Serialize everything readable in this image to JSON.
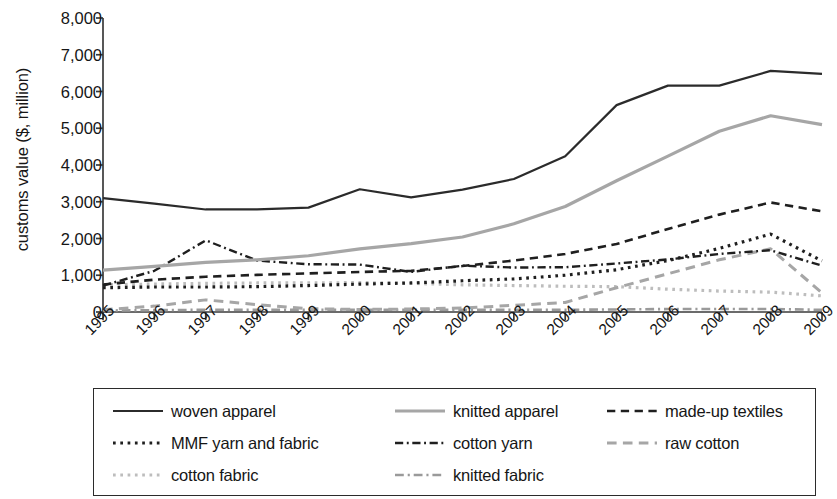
{
  "chart_data": {
    "type": "line",
    "title": "",
    "xlabel": "",
    "ylabel": "customs value ($, million)",
    "grid": false,
    "legend_position": "bottom",
    "x": [
      "1995",
      "1996",
      "1997",
      "1998",
      "1999",
      "2000",
      "2001",
      "2002",
      "2003",
      "2004",
      "2005",
      "2006",
      "2007",
      "2008",
      "2009"
    ],
    "xlim": [
      "1995",
      "2009"
    ],
    "ylim": [
      0,
      8000
    ],
    "yticks": [
      0,
      1000,
      2000,
      3000,
      4000,
      5000,
      6000,
      7000,
      8000
    ],
    "ytick_labels": [
      "0",
      "1,000",
      "2,000",
      "3,000",
      "4,000",
      "5,000",
      "6,000",
      "7,000",
      "8,000"
    ],
    "series": [
      {
        "name": "woven apparel",
        "style": "solid",
        "color": "#2b2b2b",
        "width": 2.2,
        "values": [
          3100,
          2950,
          2790,
          2790,
          2840,
          3340,
          3120,
          3330,
          3620,
          4240,
          5630,
          6160,
          6160,
          6560,
          6480
        ]
      },
      {
        "name": "knitted apparel",
        "style": "solid",
        "color": "#a6a6a6",
        "width": 3.2,
        "values": [
          1140,
          1240,
          1350,
          1420,
          1530,
          1720,
          1860,
          2040,
          2400,
          2870,
          3570,
          4240,
          4920,
          5340,
          5100
        ]
      },
      {
        "name": "made-up textiles",
        "style": "dashed",
        "color": "#1f1f1f",
        "width": 2.6,
        "values": [
          750,
          880,
          960,
          1010,
          1050,
          1090,
          1120,
          1250,
          1400,
          1580,
          1850,
          2260,
          2650,
          2980,
          2740
        ]
      },
      {
        "name": "MMF yarn and fabric",
        "style": "dotted",
        "color": "#1f1f1f",
        "width": 3.2,
        "values": [
          660,
          680,
          680,
          690,
          720,
          760,
          790,
          850,
          900,
          1000,
          1150,
          1400,
          1730,
          2120,
          1390
        ]
      },
      {
        "name": "cotton yarn",
        "style": "dashdot",
        "color": "#1f1f1f",
        "width": 2.4,
        "values": [
          720,
          1120,
          1950,
          1400,
          1300,
          1290,
          1090,
          1260,
          1210,
          1220,
          1320,
          1430,
          1580,
          1680,
          1260
        ]
      },
      {
        "name": "raw cotton",
        "style": "dashed",
        "color": "#a6a6a6",
        "width": 3.0,
        "values": [
          60,
          160,
          330,
          200,
          90,
          70,
          80,
          110,
          180,
          260,
          660,
          1040,
          1420,
          1720,
          520
        ]
      },
      {
        "name": "cotton fabric",
        "style": "dotted",
        "color": "#bdbdbd",
        "width": 3.2,
        "values": [
          740,
          760,
          780,
          790,
          790,
          800,
          780,
          740,
          720,
          700,
          690,
          620,
          570,
          540,
          440
        ]
      },
      {
        "name": "knitted fabric",
        "style": "dashdot",
        "color": "#9a9a9a",
        "width": 2.6,
        "values": [
          40,
          50,
          60,
          60,
          60,
          60,
          60,
          60,
          60,
          60,
          70,
          80,
          80,
          80,
          60
        ]
      }
    ]
  },
  "axis": {
    "y_title": "customs value ($, million)"
  },
  "legend": {
    "rows": [
      [
        {
          "label": "woven apparel",
          "series": "woven apparel"
        },
        {
          "label": "knitted apparel",
          "series": "knitted apparel"
        },
        {
          "label": "made-up textiles",
          "series": "made-up textiles"
        }
      ],
      [
        {
          "label": "MMF yarn and fabric",
          "series": "MMF yarn and fabric"
        },
        {
          "label": "cotton yarn",
          "series": "cotton yarn"
        },
        {
          "label": "raw cotton",
          "series": "raw cotton"
        }
      ],
      [
        {
          "label": "cotton fabric",
          "series": "cotton fabric"
        },
        {
          "label": "knitted fabric",
          "series": "knitted fabric"
        }
      ]
    ]
  }
}
